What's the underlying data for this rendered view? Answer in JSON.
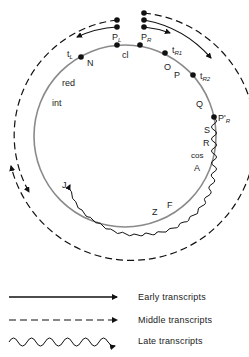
{
  "diagram": {
    "title": "",
    "genome_circle": {
      "stroke": "#8a8a8a"
    },
    "promoters": [
      {
        "name": "P",
        "sub": "L"
      },
      {
        "name": "P",
        "sub": "R"
      },
      {
        "name": "P'",
        "sub": "R"
      }
    ],
    "terminators": [
      {
        "name": "t",
        "sub": "L"
      },
      {
        "name": "t",
        "sub": "R1"
      },
      {
        "name": "t",
        "sub": "R2"
      }
    ],
    "genes": [
      "N",
      "cl",
      "O",
      "P",
      "Q",
      "S",
      "R",
      "cos",
      "A",
      "F",
      "Z",
      "J",
      "int",
      "red"
    ]
  },
  "labels": {
    "PL": "P",
    "PL_sub": "L",
    "PR": "P",
    "PR_sub": "R",
    "PRp": "P'",
    "PRp_sub": "R",
    "tL": "t",
    "tL_sub": "L",
    "tR1": "t",
    "tR1_sub": "R1",
    "tR2": "t",
    "tR2_sub": "R2",
    "N": "N",
    "cl": "cl",
    "O": "O",
    "P": "P",
    "Q": "Q",
    "S": "S",
    "R": "R",
    "cos": "cos",
    "A": "A",
    "F": "F",
    "Z": "Z",
    "J": "J",
    "int": "int",
    "red": "red"
  },
  "legend": {
    "items": [
      {
        "style": "solid",
        "label": "Early transcripts"
      },
      {
        "style": "dashed",
        "label": "Middle transcripts"
      },
      {
        "style": "wavy",
        "label": "Late transcripts"
      }
    ]
  }
}
